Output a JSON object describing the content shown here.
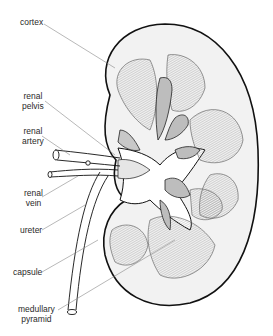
{
  "diagram": {
    "labels": [
      {
        "id": "cortex",
        "lines": [
          "cortex"
        ]
      },
      {
        "id": "renal-pelvis",
        "lines": [
          "renal",
          "pelvis"
        ]
      },
      {
        "id": "renal-artery",
        "lines": [
          "renal",
          "artery"
        ]
      },
      {
        "id": "renal-vein",
        "lines": [
          "renal",
          "vein"
        ]
      },
      {
        "id": "ureter",
        "lines": [
          "ureter"
        ]
      },
      {
        "id": "capsule",
        "lines": [
          "capsule"
        ]
      },
      {
        "id": "medullary-pyramid",
        "lines": [
          "medullary",
          "pyramid"
        ]
      }
    ],
    "colors": {
      "outline": "#111111",
      "cortex_fill": "#f2f2f2",
      "pyramid_fill": "#d4d4d4",
      "calyx_fill": "#bdbdbd",
      "leader_line": "#888888",
      "label_text": "#2a2a2a"
    }
  }
}
